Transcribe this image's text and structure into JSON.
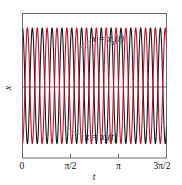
{
  "figure": {
    "background": "#ffffff",
    "frame_color": "#6a6a6a",
    "axis_label_x": "t",
    "axis_label_y": "x"
  },
  "annotations": {
    "upper": {
      "text_prefix": "x = x",
      "sub": "1",
      "suffix": "(t)",
      "full": "x = x1(t)"
    },
    "lower": {
      "text_prefix": "x = x",
      "sub": "2",
      "suffix": "(t)",
      "full": "x = x2(t)"
    }
  },
  "ticks": {
    "x_labels": [
      "0",
      "π/2",
      "π",
      "3π/2"
    ],
    "x_values": [
      0,
      1.5707963,
      3.1415927,
      4.712389
    ]
  },
  "chart_data": {
    "type": "line",
    "title": "",
    "xlabel": "t",
    "ylabel": "x",
    "xlim": [
      0,
      4.712389
    ],
    "ylim": [
      -1.25,
      1.25
    ],
    "grid": false,
    "legend": "inline-annotations",
    "xtick_labels": [
      "0",
      "π/2",
      "π",
      "3π/2"
    ],
    "xtick_values": [
      0,
      1.5707963,
      3.1415927,
      4.712389
    ],
    "ytick_labels": [],
    "ytick_values": [],
    "series": [
      {
        "name": "x = x1(t)",
        "color": "#1a1a1a",
        "linewidth": 1.1,
        "form": "cosine",
        "amplitude": 1.0,
        "angular_frequency": 19.5,
        "phase": 0.0,
        "cycles_over_range": 14.6,
        "annotation": "x = x1(t)"
      },
      {
        "name": "x = x2(t)",
        "color": "#c2102b",
        "linewidth": 1.1,
        "form": "cosine",
        "amplitude": 1.0,
        "angular_frequency": 19.5,
        "phase": 3.14159,
        "cycles_over_range": 14.6,
        "annotation": "x = x2(t)"
      }
    ]
  }
}
